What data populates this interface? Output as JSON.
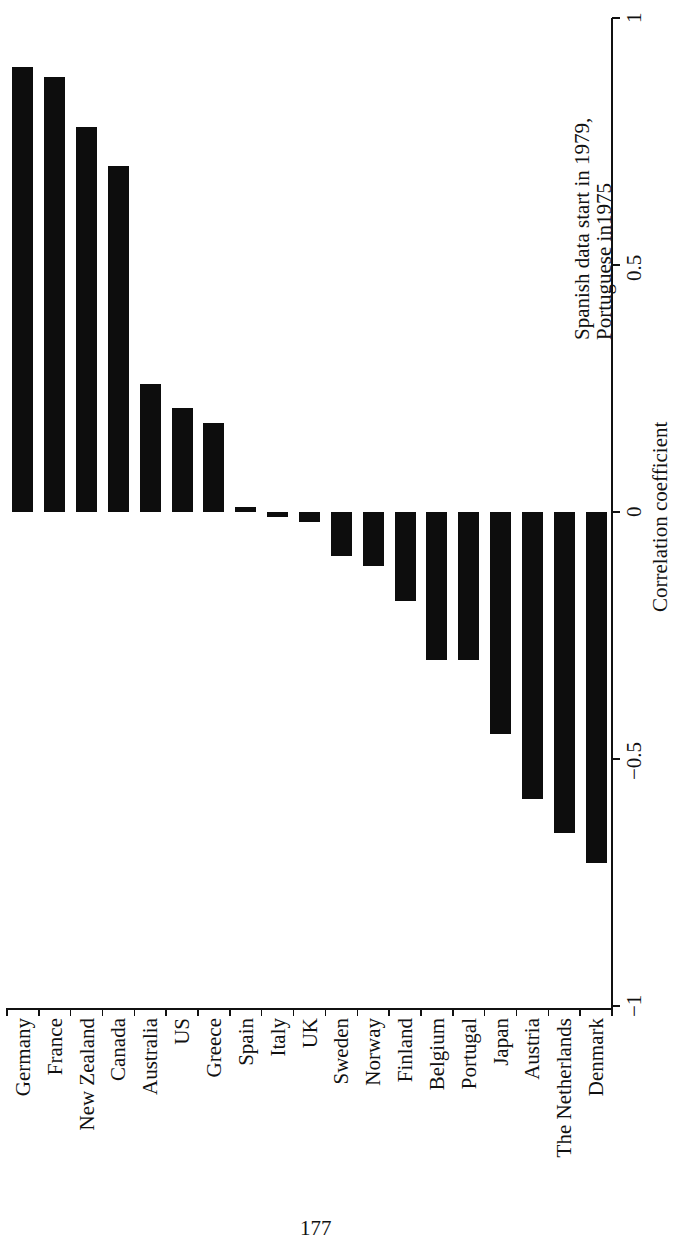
{
  "chart_data": {
    "type": "bar",
    "orientation": "rotated (horizontal bars rendered vertically; page rotated 90°)",
    "title": "",
    "xlabel": "",
    "ylabel": "Correlation coefficient",
    "ylim": [
      -1,
      1
    ],
    "yticks": [
      "1",
      "0.5",
      "0",
      "-0.5",
      "-1"
    ],
    "grid": false,
    "legend": null,
    "annotation": [
      "Spanish data start in 1979,",
      "Portuguese in1975"
    ],
    "categories": [
      "Germany",
      "France",
      "New Zealand",
      "Canada",
      "Australia",
      "US",
      "Greece",
      "Spain",
      "Italy",
      "UK",
      "Sweden",
      "Norway",
      "Finland",
      "Belgium",
      "Portugal",
      "Japan",
      "Austria",
      "The Netherlands",
      "Denmark"
    ],
    "values": [
      0.9,
      0.88,
      0.78,
      0.7,
      0.26,
      0.21,
      0.18,
      0.01,
      -0.01,
      -0.02,
      -0.09,
      -0.11,
      -0.18,
      -0.3,
      -0.3,
      -0.45,
      -0.58,
      -0.65,
      -0.71
    ]
  },
  "axis": {
    "title": "Correlation coefficient",
    "tick_labels": [
      "1",
      "0.5",
      "0",
      "−0.5",
      "−1"
    ]
  },
  "annotation": {
    "line1": "Spanish data start in 1979,",
    "line2": "Portuguese in1975"
  },
  "page": {
    "number": "177"
  },
  "colors": {
    "bar": "#0d0d0d",
    "background": "#ffffff"
  }
}
